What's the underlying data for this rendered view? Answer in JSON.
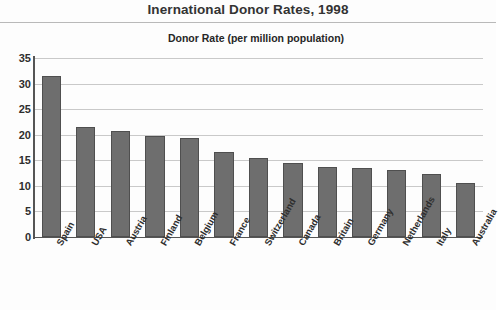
{
  "chart_data": {
    "type": "bar",
    "title": "Inernational Donor Rates, 1998",
    "subtitle": "Donor Rate (per million population)",
    "xlabel": "",
    "ylabel": "Donor Rate (per million population)",
    "ylim": [
      0,
      35
    ],
    "ytick_labels": [
      "0",
      "5",
      "10",
      "15",
      "20",
      "25",
      "30",
      "35"
    ],
    "ytick_values": [
      0,
      5,
      10,
      15,
      20,
      25,
      30,
      35
    ],
    "grid": true,
    "legend": false,
    "orientation": "vertical",
    "categories": [
      "Spain",
      "USA",
      "Austria",
      "Finland",
      "Belgium",
      "France",
      "Switzerland",
      "Canada",
      "Britain",
      "Germany",
      "Netherlands",
      "Italy",
      "Australia"
    ],
    "values": [
      31.5,
      21.5,
      20.8,
      19.7,
      19.4,
      16.7,
      15.4,
      14.5,
      13.7,
      13.5,
      13.1,
      12.3,
      10.6
    ],
    "bar_color": "#6e6e6e",
    "bar_edge_color": "#4f4f4f",
    "grid_color": "#c9c9c9",
    "axis_color": "#555555",
    "text_color": "#2e2e2e",
    "background_color": "#fdfdfd"
  }
}
